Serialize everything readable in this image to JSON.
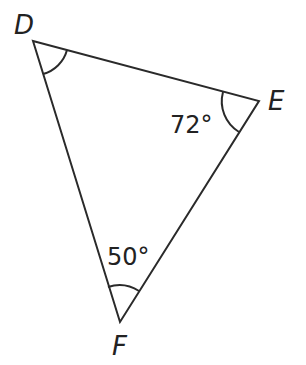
{
  "diagram": {
    "type": "triangle",
    "vertices": [
      {
        "label": "D",
        "x": 33,
        "y": 41
      },
      {
        "label": "E",
        "x": 259,
        "y": 101
      },
      {
        "label": "F",
        "x": 120,
        "y": 322
      }
    ],
    "angles": [
      {
        "vertex": "D",
        "value": "",
        "marked": true
      },
      {
        "vertex": "E",
        "value": "72°",
        "marked": true
      },
      {
        "vertex": "F",
        "value": "50°",
        "marked": true
      }
    ],
    "stroke_color": "#2a2a2a"
  }
}
